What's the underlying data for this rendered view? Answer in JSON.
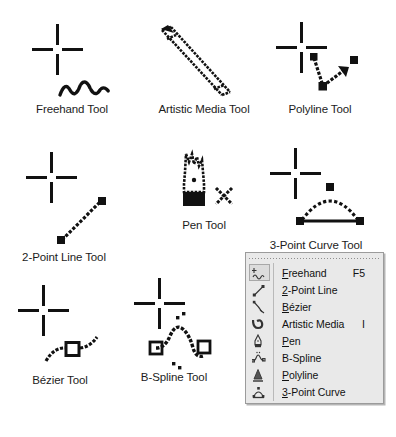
{
  "figures": [
    {
      "id": "freehand-tool",
      "label": "Freehand Tool",
      "icon": "freehand-squiggle-icon"
    },
    {
      "id": "artistic-media-tool",
      "label": "Artistic Media Tool",
      "icon": "paintbrush-icon"
    },
    {
      "id": "polyline-tool",
      "label": "Polyline Tool",
      "icon": "polyline-arrow-icon"
    },
    {
      "id": "two-point-line-tool",
      "label": "2-Point Line Tool",
      "icon": "line-with-nodes-icon"
    },
    {
      "id": "pen-tool",
      "label": "Pen Tool",
      "icon": "pen-nib-icon"
    },
    {
      "id": "three-point-curve-tool",
      "label": "3-Point Curve Tool",
      "icon": "arc-three-node-icon"
    },
    {
      "id": "bezier-tool",
      "label": "Bézier Tool",
      "icon": "bezier-node-icon"
    },
    {
      "id": "b-spline-tool",
      "label": "B-Spline Tool",
      "icon": "b-spline-curve-icon"
    }
  ],
  "flyout": {
    "name": "curve-tools-flyout",
    "items": [
      {
        "id": "freehand",
        "label": "Freehand",
        "mnemonic": "F",
        "accel": "F5",
        "icon": "freehand-menu-icon",
        "selected": true
      },
      {
        "id": "two-point-line",
        "label": "2-Point Line",
        "mnemonic": "2",
        "accel": "",
        "icon": "two-point-line-menu-icon",
        "selected": false
      },
      {
        "id": "bezier",
        "label": "Bézier",
        "mnemonic": "B",
        "accel": "",
        "icon": "bezier-menu-icon",
        "selected": false
      },
      {
        "id": "artistic-media",
        "label": "Artistic Media",
        "mnemonic": "",
        "accel": "I",
        "icon": "artistic-media-menu-icon",
        "selected": false
      },
      {
        "id": "pen",
        "label": "Pen",
        "mnemonic": "P",
        "accel": "",
        "icon": "pen-menu-icon",
        "selected": false
      },
      {
        "id": "b-spline",
        "label": "B-Spline",
        "mnemonic": "",
        "accel": "",
        "icon": "b-spline-menu-icon",
        "selected": false
      },
      {
        "id": "polyline",
        "label": "Polyline",
        "mnemonic": "P",
        "accel": "",
        "icon": "polyline-menu-icon",
        "selected": false
      },
      {
        "id": "three-point-curve",
        "label": "3-Point Curve",
        "mnemonic": "3",
        "accel": "",
        "icon": "three-point-curve-menu-icon",
        "selected": false
      }
    ]
  },
  "colors": {
    "ink": "#111111",
    "page_background": "#ffffff",
    "menu_face": "#e9e9e9",
    "menu_border": "#9b9b9b",
    "menu_selected": "#dcdcdc"
  }
}
